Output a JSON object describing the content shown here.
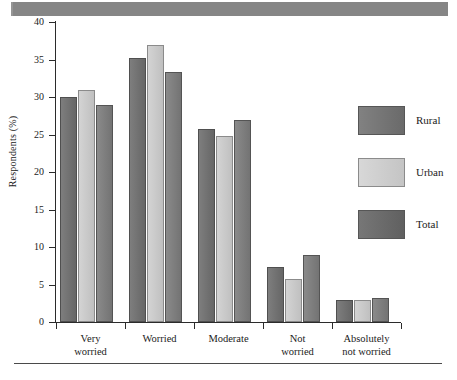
{
  "banner": {
    "name": "scan-banner",
    "color": "#8d8d8d"
  },
  "chart_data": {
    "type": "bar",
    "title": "",
    "xlabel": "",
    "ylabel": "Respondents (%)",
    "ylim": [
      0,
      40
    ],
    "yticks": [
      0,
      5,
      10,
      15,
      20,
      25,
      30,
      35,
      40
    ],
    "ytick_labels": [
      "0",
      "5",
      "10",
      "15",
      "20",
      "25",
      "30",
      "35",
      "40"
    ],
    "grid": false,
    "legend_position": "right",
    "categories": [
      "Very\nworried",
      "Worried",
      "Moderate",
      "Not\nworried",
      "Absolutely\nnot worried"
    ],
    "category_lines": [
      [
        "Very",
        "worried"
      ],
      [
        "Worried"
      ],
      [
        "Moderate"
      ],
      [
        "Not",
        "worried"
      ],
      [
        "Absolutely",
        "not worried"
      ]
    ],
    "series": [
      {
        "name": "Rural",
        "color": "#6f6f6f",
        "values": [
          30.0,
          35.2,
          25.8,
          7.3,
          3.0
        ]
      },
      {
        "name": "Urban",
        "color": "#cacaca",
        "values": [
          31.0,
          37.0,
          24.8,
          5.7,
          2.9
        ]
      },
      {
        "name": "Total",
        "color": "#7d7d7d",
        "values": [
          29.0,
          33.4,
          27.0,
          9.0,
          3.2
        ]
      }
    ]
  },
  "legend": {
    "items": [
      {
        "label": "Rural",
        "key": "rural"
      },
      {
        "label": "Urban",
        "key": "urban"
      },
      {
        "label": "Total",
        "key": "total"
      }
    ]
  }
}
